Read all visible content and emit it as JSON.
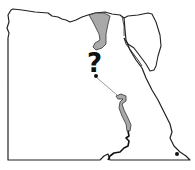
{
  "map": {
    "subject": "Egypt outline map",
    "annotation": "?",
    "colors": {
      "border": "#222222",
      "nile_fill": "#a9a9a9",
      "background": "#ffffff",
      "marker": "#111111"
    },
    "features": [
      "national-border",
      "sinai-peninsula",
      "nile-delta",
      "nile-river-segment",
      "lake-nasser",
      "route-line",
      "marker-point",
      "marker-point-southeast"
    ]
  }
}
